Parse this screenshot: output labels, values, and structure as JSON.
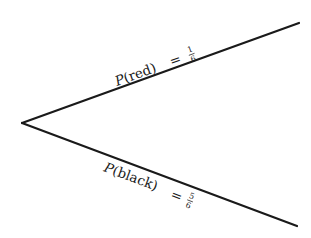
{
  "diagram": {
    "type": "probability-tree",
    "branches": [
      {
        "outcome": "red",
        "label_prefix": "P",
        "label_arg": "(red)",
        "equals": "=",
        "probability": {
          "numerator": "1",
          "denominator": "6"
        }
      },
      {
        "outcome": "black",
        "label_prefix": "P",
        "label_arg": "(black)",
        "equals": "=",
        "probability": {
          "numerator": "5",
          "denominator": "6"
        }
      }
    ],
    "colors": {
      "line": "#1a1a1a",
      "text": "#1a1a1a",
      "background": "#ffffff"
    }
  }
}
